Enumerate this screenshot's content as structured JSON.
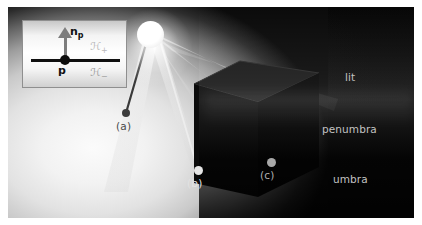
{
  "figure": {
    "caption_points": [
      {
        "id": "a",
        "label": "(a)",
        "x": 112,
        "y": 126,
        "dot_x": 118,
        "dot_y": 106,
        "kind": "lit-point-dark-dot"
      },
      {
        "id": "b",
        "label": "(b)",
        "x": 182,
        "y": 180,
        "dot_x": 190,
        "dot_y": 163,
        "kind": "penumbra-point-light-dot"
      },
      {
        "id": "c",
        "label": "(c)",
        "x": 255,
        "y": 171,
        "dot_x": 263,
        "dot_y": 155,
        "kind": "umbra-point-gray-dot"
      }
    ],
    "zones": [
      {
        "name": "lit",
        "label": "lit",
        "x": 345,
        "y": 71,
        "color": "#c9c9c9"
      },
      {
        "name": "penumbra",
        "label": "penumbra",
        "x": 322,
        "y": 123,
        "color": "#bdbdbd"
      },
      {
        "name": "umbra",
        "label": "umbra",
        "x": 333,
        "y": 173,
        "color": "#b5b5b5"
      }
    ],
    "light_source": {
      "name": "area-light",
      "x": 129,
      "y": 14,
      "diameter": 27,
      "color": "#ffffff"
    },
    "occluder": {
      "name": "cube",
      "color": "#0c0c0c"
    },
    "background_color": "#050505",
    "page_color": "#ffffff"
  },
  "inset": {
    "title": "tangent-plane-diagram",
    "point_label": "p",
    "normal_label": "n",
    "normal_subscript": "p",
    "halfspace_upper": "ℋ",
    "halfspace_upper_sub": "+",
    "halfspace_lower": "ℋ",
    "halfspace_lower_sub": "−",
    "background": "#ffffff",
    "line_color": "#101010",
    "arrow_color": "#7d7d7d"
  }
}
